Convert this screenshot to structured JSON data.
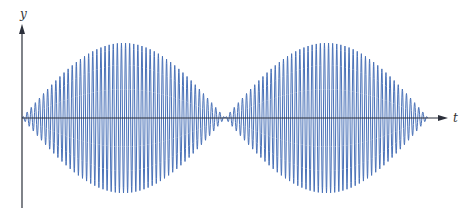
{
  "chart_data": {
    "type": "line",
    "title": "",
    "xlabel": "t",
    "ylabel": "y",
    "envelope": {
      "shape": "sine",
      "lobes": 2,
      "t_start": 0,
      "t_node": 0.5,
      "t_end": 1.0,
      "amplitude": 1.0
    },
    "carrier": {
      "cycles": 99
    },
    "grid": false,
    "legend": false,
    "xlim": [
      0,
      1.0
    ],
    "ylim": [
      -1.0,
      1.0
    ],
    "series": [
      {
        "name": "modulated-wave",
        "color": "#4a72b8"
      }
    ]
  },
  "axes": {
    "x_label": "t",
    "y_label": "y",
    "axis_color": "#2b2f3a"
  },
  "layout": {
    "origin_x": 22,
    "origin_y": 118,
    "wave_x_start": 22,
    "wave_x_end": 428,
    "amplitude_px": 75,
    "x_axis_end": 448,
    "y_axis_top": 24,
    "y_axis_bottom": 208
  }
}
